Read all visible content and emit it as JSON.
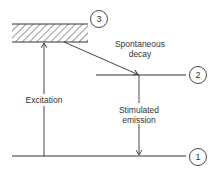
{
  "diagram": {
    "type": "energy-level-diagram",
    "levels": [
      {
        "id": "3",
        "label": "3",
        "style": "hatched-band",
        "y_top": 24,
        "y_bottom": 42,
        "x_start": 12,
        "x_end": 88
      },
      {
        "id": "2",
        "label": "2",
        "style": "line",
        "y": 75,
        "x_start": 96,
        "x_end": 186
      },
      {
        "id": "1",
        "label": "1",
        "style": "line",
        "y": 156,
        "x_start": 12,
        "x_end": 186
      }
    ],
    "transitions": [
      {
        "name": "excitation",
        "label": "Excitation",
        "from": "1",
        "to": "3",
        "direction": "up"
      },
      {
        "name": "spontaneous-decay",
        "label_line1": "Spontaneous",
        "label_line2": "decay",
        "from": "3",
        "to": "2",
        "direction": "diagonal-down"
      },
      {
        "name": "stimulated-emission",
        "label_line1": "Stimulated",
        "label_line2": "emission",
        "from": "2",
        "to": "1",
        "direction": "down"
      }
    ],
    "line_color": "#333333"
  }
}
